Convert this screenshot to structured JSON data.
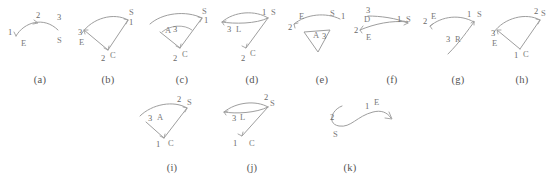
{
  "figure": {
    "background": "#ffffff",
    "stroke_color": "#9a9a9a",
    "label_color": "#7a7a7a",
    "caption_color": "#555555",
    "panel_count": 11
  },
  "panels": [
    {
      "id": "a",
      "caption": "(a)",
      "labels": [
        {
          "text": "1",
          "x": 8,
          "y": 26
        },
        {
          "text": "2",
          "x": 36,
          "y": 9
        },
        {
          "text": "3",
          "x": 57,
          "y": 11
        },
        {
          "text": "E",
          "x": 21,
          "y": 37
        },
        {
          "text": "S",
          "x": 57,
          "y": 34
        }
      ]
    },
    {
      "id": "b",
      "caption": "(b)",
      "labels": [
        {
          "text": "S",
          "x": 61,
          "y": 6
        },
        {
          "text": "1",
          "x": 61,
          "y": 16
        },
        {
          "text": "3",
          "x": 10,
          "y": 26
        },
        {
          "text": "E",
          "x": 11,
          "y": 36
        },
        {
          "text": "2",
          "x": 33,
          "y": 52
        },
        {
          "text": "C",
          "x": 42,
          "y": 49
        }
      ]
    },
    {
      "id": "c",
      "caption": "(c)",
      "labels": [
        {
          "text": "S",
          "x": 60,
          "y": 5
        },
        {
          "text": "1",
          "x": 62,
          "y": 14
        },
        {
          "text": "A",
          "x": 23,
          "y": 24
        },
        {
          "text": "3",
          "x": 31,
          "y": 23
        },
        {
          "text": "2",
          "x": 31,
          "y": 52
        },
        {
          "text": "C",
          "x": 40,
          "y": 48
        }
      ]
    },
    {
      "id": "d",
      "caption": "(d)",
      "labels": [
        {
          "text": "1",
          "x": 50,
          "y": 6
        },
        {
          "text": "S",
          "x": 59,
          "y": 6
        },
        {
          "text": "3",
          "x": 15,
          "y": 23
        },
        {
          "text": "L",
          "x": 24,
          "y": 23
        },
        {
          "text": "2",
          "x": 29,
          "y": 52
        },
        {
          "text": "C",
          "x": 38,
          "y": 47
        }
      ]
    },
    {
      "id": "e",
      "caption": "(e)",
      "labels": [
        {
          "text": "E",
          "x": 17,
          "y": 10
        },
        {
          "text": "S",
          "x": 48,
          "y": 7
        },
        {
          "text": "1",
          "x": 59,
          "y": 10
        },
        {
          "text": "2",
          "x": 6,
          "y": 21
        },
        {
          "text": "A",
          "x": 31,
          "y": 29
        },
        {
          "text": "3",
          "x": 40,
          "y": 30
        }
      ]
    },
    {
      "id": "f",
      "caption": "(f)",
      "labels": [
        {
          "text": "3",
          "x": 14,
          "y": 4
        },
        {
          "text": "D",
          "x": 12,
          "y": 13
        },
        {
          "text": "1",
          "x": 45,
          "y": 13
        },
        {
          "text": "S",
          "x": 54,
          "y": 13
        },
        {
          "text": "2",
          "x": 2,
          "y": 24
        },
        {
          "text": "E",
          "x": 14,
          "y": 31
        }
      ]
    },
    {
      "id": "g",
      "caption": "(g)",
      "labels": [
        {
          "text": "2",
          "x": 5,
          "y": 15
        },
        {
          "text": "E",
          "x": 13,
          "y": 10
        },
        {
          "text": "1",
          "x": 49,
          "y": 8
        },
        {
          "text": "S",
          "x": 59,
          "y": 8
        },
        {
          "text": "3",
          "x": 28,
          "y": 33
        },
        {
          "text": "R",
          "x": 37,
          "y": 33
        }
      ]
    },
    {
      "id": "h",
      "caption": "(h)",
      "labels": [
        {
          "text": "2",
          "x": 52,
          "y": 5
        },
        {
          "text": "S",
          "x": 59,
          "y": 7
        },
        {
          "text": "3",
          "x": 9,
          "y": 27
        },
        {
          "text": "E",
          "x": 10,
          "y": 37
        },
        {
          "text": "1",
          "x": 32,
          "y": 49
        },
        {
          "text": "C",
          "x": 41,
          "y": 48
        }
      ]
    },
    {
      "id": "i",
      "caption": "(i)",
      "labels": [
        {
          "text": "2",
          "x": 45,
          "y": 5
        },
        {
          "text": "S",
          "x": 55,
          "y": 8
        },
        {
          "text": "3",
          "x": 16,
          "y": 24
        },
        {
          "text": "A",
          "x": 25,
          "y": 23
        },
        {
          "text": "1",
          "x": 24,
          "y": 50
        },
        {
          "text": "C",
          "x": 36,
          "y": 49
        }
      ]
    },
    {
      "id": "j",
      "caption": "(j)",
      "labels": [
        {
          "text": "2",
          "x": 52,
          "y": 3
        },
        {
          "text": "S",
          "x": 58,
          "y": 9
        },
        {
          "text": "3",
          "x": 20,
          "y": 24
        },
        {
          "text": "L",
          "x": 28,
          "y": 23
        },
        {
          "text": "1",
          "x": 21,
          "y": 49
        },
        {
          "text": "C",
          "x": 37,
          "y": 49
        }
      ]
    },
    {
      "id": "k",
      "caption": "(k)",
      "labels": [
        {
          "text": "1",
          "x": 70,
          "y": 12
        },
        {
          "text": "E",
          "x": 79,
          "y": 8
        },
        {
          "text": "2",
          "x": 35,
          "y": 23
        },
        {
          "text": "S",
          "x": 38,
          "y": 40
        }
      ]
    }
  ]
}
